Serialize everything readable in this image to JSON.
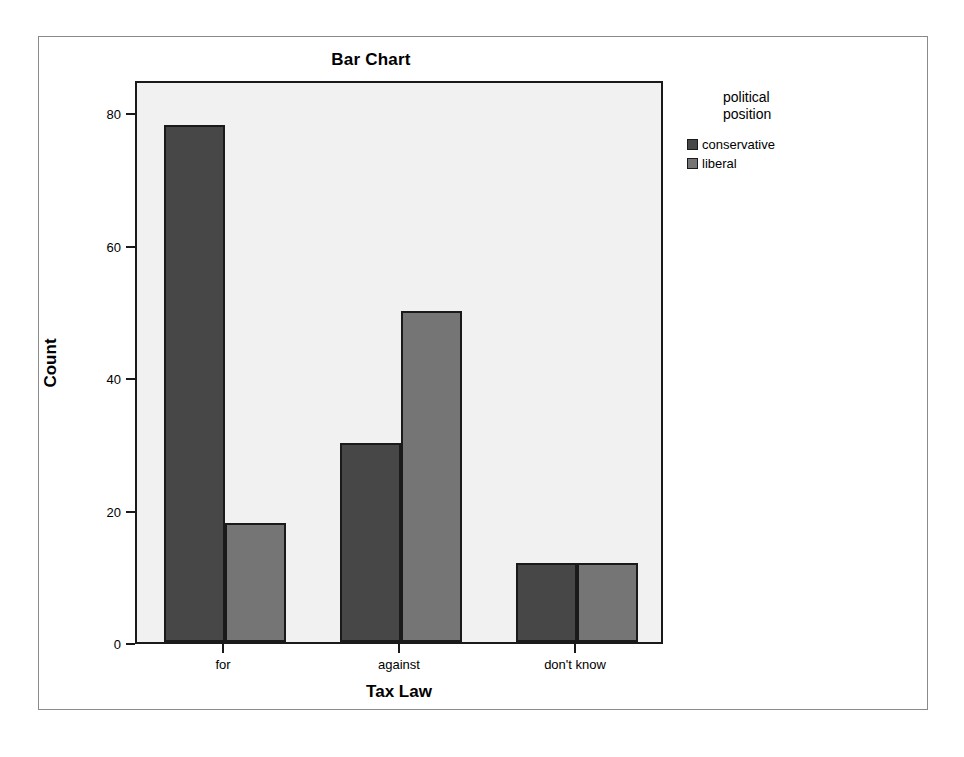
{
  "chart_data": {
    "type": "bar",
    "title": "Bar Chart",
    "xlabel": "Tax Law",
    "ylabel": "Count",
    "categories": [
      "for",
      "against",
      "don't know"
    ],
    "series": [
      {
        "name": "conservative",
        "values": [
          78,
          30,
          12
        ],
        "color": "#474747"
      },
      {
        "name": "liberal",
        "values": [
          18,
          50,
          12
        ],
        "color": "#757575"
      }
    ],
    "legend_title": "political\nposition",
    "legend_position": "right",
    "ylim": [
      0,
      85
    ],
    "yticks": [
      0,
      20,
      40,
      60,
      80
    ],
    "ytick_labels": [
      "0",
      "20",
      "40",
      "60",
      "80"
    ],
    "grid": false,
    "grouping": "clustered",
    "plot_background": "#f1f1f1",
    "axis_color": "#1a1a1a",
    "frame_color": "#8a8a8a"
  }
}
